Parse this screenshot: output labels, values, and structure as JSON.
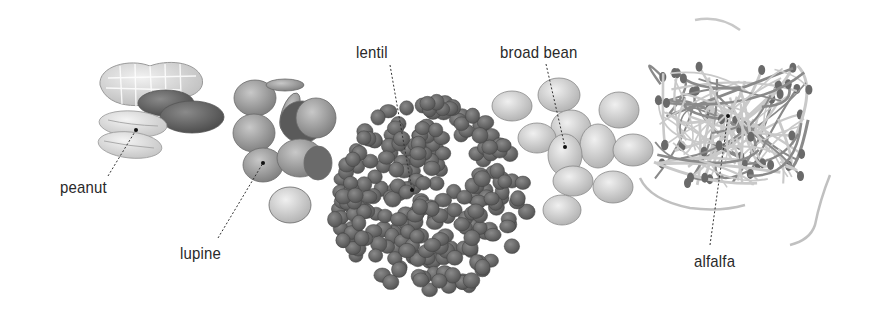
{
  "figure": {
    "background": "#ffffff",
    "label_color": "#2a2a2a",
    "items": [
      {
        "id": "peanut",
        "label": "peanut",
        "label_pos": [
          60,
          178
        ],
        "leader_from": [
          108,
          176
        ],
        "leader_to": [
          136,
          130
        ]
      },
      {
        "id": "lupine",
        "label": "lupine",
        "label_pos": [
          180,
          244
        ],
        "leader_from": [
          218,
          238
        ],
        "leader_to": [
          263,
          163
        ]
      },
      {
        "id": "lentil",
        "label": "lentil",
        "label_pos": [
          356,
          43
        ],
        "leader_from": [
          390,
          65
        ],
        "leader_to": [
          412,
          190
        ]
      },
      {
        "id": "broad-bean",
        "label": "broad bean",
        "label_pos": [
          500,
          43
        ],
        "leader_from": [
          546,
          64
        ],
        "leader_to": [
          565,
          147
        ]
      },
      {
        "id": "alfalfa",
        "label": "alfalfa",
        "label_pos": [
          694,
          252
        ],
        "leader_from": [
          710,
          245
        ],
        "leader_to": [
          728,
          116
        ]
      }
    ]
  }
}
